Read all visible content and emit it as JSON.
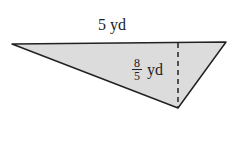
{
  "figure": {
    "shape": "triangle",
    "fill_color": "#dcdcdc",
    "stroke_color": "#222222",
    "base_label": "5 yd",
    "height_label": {
      "numerator": "8",
      "denominator": "5",
      "unit": "yd"
    },
    "height_line_style": "dashed"
  }
}
